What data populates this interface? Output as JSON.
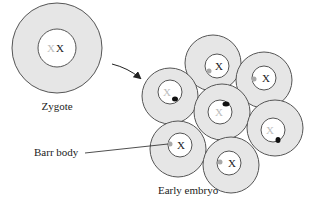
{
  "labels": {
    "zygote": "Zygote",
    "barr_body": "Barr body",
    "early_embryo": "Early embryo"
  },
  "chromosome": "X",
  "colors": {
    "cytoplasm": "#e6e6e6",
    "nucleus": "#ffffff",
    "outline": "#555555",
    "barr_body_active": "#111111",
    "barr_body_faded": "#a8a8a8",
    "inactive_x": "#bdbdbd"
  },
  "zygote": {
    "active_x": "X",
    "inactive_x": "X"
  },
  "embryo_cells": [
    {
      "id": "top",
      "inactive_x_label": "",
      "active_x": "X",
      "barr_body": "gray"
    },
    {
      "id": "right-top",
      "active_x": "X",
      "barr_body": "gray"
    },
    {
      "id": "left-mid",
      "active_x": "X",
      "barr_body": "black"
    },
    {
      "id": "center",
      "active_x": "X",
      "barr_body": "black"
    },
    {
      "id": "right-lower",
      "active_x": "X",
      "barr_body": "black"
    },
    {
      "id": "lower-left",
      "active_x": "X",
      "barr_body": "gray"
    },
    {
      "id": "lower",
      "active_x": "X",
      "barr_body": "gray"
    }
  ]
}
